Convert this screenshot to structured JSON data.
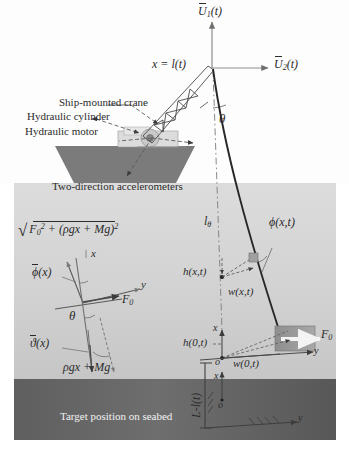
{
  "figure": {
    "type": "engineering-schematic",
    "background": "#ffffff",
    "regions": {
      "air": {
        "name": "air-above-waterline",
        "color": "#fdfdfd"
      },
      "water": {
        "name": "water-column",
        "color": "#d8d8d8"
      },
      "seabed": {
        "name": "seabed-band",
        "color": "#6a6a6a"
      },
      "hull": {
        "name": "ship-hull",
        "color": "#7b7b7b"
      },
      "deck": {
        "name": "deck-machinery",
        "color": "#d5d5d5"
      },
      "payload": {
        "name": "payload-block",
        "color": "#9a9a9a"
      }
    }
  },
  "callouts": {
    "crane": "Ship-mounted crane",
    "cylinder": "Hydraulic cylinder",
    "motor": "Hydraulic motor",
    "accelerometers": "Two-direction accelerometers",
    "seabed_target": "Target position on seabed"
  },
  "axes": {
    "u1": {
      "base": "U",
      "sub": "1",
      "arg": "(t)"
    },
    "u2": {
      "base": "U",
      "sub": "2",
      "arg": "(t)"
    },
    "origin_top": {
      "lhs": "x",
      "eq": " = ",
      "rhs": "l",
      "arg": "(t)"
    },
    "x_axis_fbd": "x",
    "y_axis_fbd": "y",
    "x_axis_payload": "x",
    "y_axis_payload": "y",
    "x_axis_seabed": "x",
    "y_axis_seabed": "y",
    "origin_payload": "o",
    "origin_seabed": "o"
  },
  "variables": {
    "theta_top": "θ",
    "theta_fbd": "θ",
    "l_theta": {
      "base": "l",
      "sub": "θ"
    },
    "phi_xt": {
      "base": "ϕ",
      "arg": "(x,t)"
    },
    "phi_bar": {
      "base": "ϕ",
      "arg": "(x)"
    },
    "vartheta_bar": {
      "base": "ϑ",
      "arg": "(x)"
    },
    "h_xt": {
      "base": "h",
      "arg": "(x,t)"
    },
    "w_xt": {
      "base": "w",
      "arg": "(x,t)"
    },
    "h_0t": {
      "base": "h",
      "arg": "(0,t)"
    },
    "w_0t": {
      "base": "w",
      "arg": "(0,t)"
    },
    "L_minus_lt": {
      "text": "L-l(t)"
    },
    "F0_cable": {
      "base": "F",
      "sub": "0"
    },
    "F0_payload": {
      "base": "F",
      "sub": "0"
    }
  },
  "equations": {
    "tension_magnitude": {
      "radicand_lead": "F",
      "radicand_lead_sub": "0",
      "radicand_lead_sup": "2",
      "plus": " + (",
      "rho_term": "ρgx",
      "plus2": " + ",
      "mg_term": "Mg",
      "close": ")",
      "close_sup": "2"
    },
    "weight_term": {
      "rho": "ρgx",
      "plus": " + ",
      "mg": "Mg"
    }
  }
}
